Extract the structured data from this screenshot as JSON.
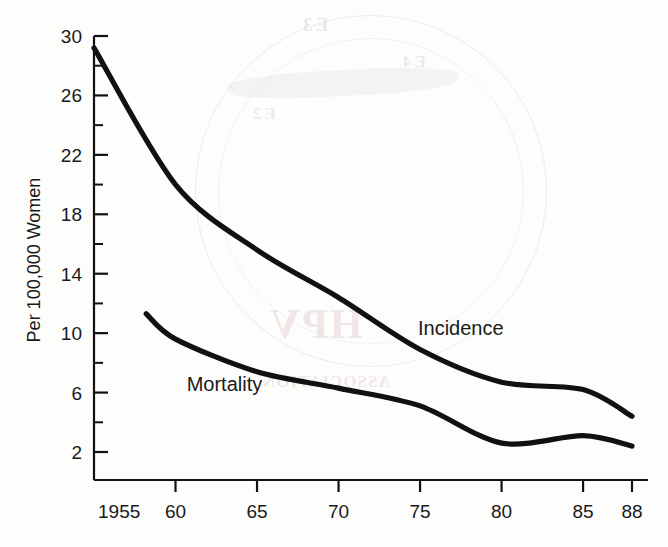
{
  "figure": {
    "background_color": "#fdfdfc",
    "line_color": "#111111",
    "text_color": "#1a1a1a"
  },
  "watermark": {
    "hpv_text": "HPV",
    "sub_text": "ASSOCIATION",
    "top_text_1": "E3",
    "top_text_2": "E4",
    "top_text_3": "E2"
  },
  "chart_data": {
    "type": "line",
    "title": "",
    "subtitle": "",
    "xlabel": "",
    "ylabel": "Per 100,000 Women",
    "xlim": [
      1955,
      1988
    ],
    "ylim": [
      0,
      31
    ],
    "grid": false,
    "legend_position": "inline-annotation",
    "x_ticks": [
      1955,
      1960,
      1965,
      1970,
      1975,
      1980,
      1985,
      1988
    ],
    "x_tick_labels": [
      "1955",
      "60",
      "65",
      "70",
      "75",
      "80",
      "85",
      "88"
    ],
    "y_ticks": [
      2,
      6,
      10,
      14,
      18,
      22,
      26,
      30
    ],
    "y_tick_labels": [
      "2",
      "6",
      "10",
      "14",
      "18",
      "22",
      "26",
      "30"
    ],
    "y_minor_ticks": [
      4,
      8,
      12,
      16,
      20,
      24,
      28
    ],
    "series": [
      {
        "name": "Incidence",
        "label_x": 1977.5,
        "label_y": 9.9,
        "x": [
          1955,
          1960,
          1965,
          1970,
          1975,
          1980,
          1985,
          1988
        ],
        "values": [
          29.2,
          20.0,
          15.6,
          12.4,
          8.9,
          6.7,
          6.2,
          4.4
        ]
      },
      {
        "name": "Mortality",
        "label_x": 1963.0,
        "label_y": 6.1,
        "x": [
          1958.2,
          1960,
          1965,
          1970,
          1975,
          1980,
          1985,
          1988
        ],
        "values": [
          11.3,
          9.6,
          7.4,
          6.3,
          5.1,
          2.6,
          3.1,
          2.4
        ]
      }
    ]
  }
}
